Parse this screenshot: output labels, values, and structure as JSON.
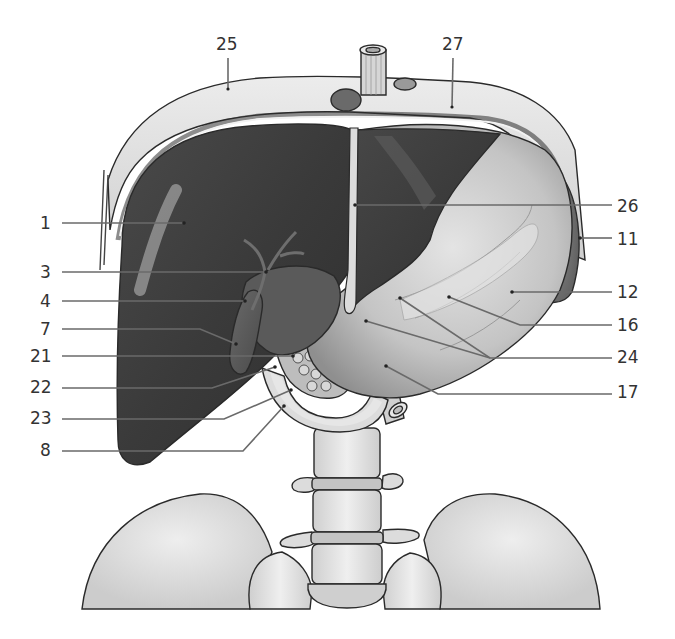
{
  "figure": {
    "colors": {
      "background": "#ffffff",
      "liver_dark": "#3e3e3e",
      "liver_mid": "#555555",
      "diaphragm": "#dcdcdc",
      "stomach": "#c8c8c8",
      "bone": "#e6e6e6",
      "label_text": "#333333",
      "leader_line": "#6a6a6a"
    },
    "labels": [
      {
        "id": "25",
        "text": "25",
        "side": "top",
        "x": 228,
        "y": 50
      },
      {
        "id": "27",
        "text": "27",
        "side": "top",
        "x": 453,
        "y": 50
      },
      {
        "id": "1",
        "text": "1",
        "side": "left",
        "x": 50,
        "y": 229
      },
      {
        "id": "3",
        "text": "3",
        "side": "left",
        "x": 50,
        "y": 278
      },
      {
        "id": "4",
        "text": "4",
        "side": "left",
        "x": 50,
        "y": 307
      },
      {
        "id": "7",
        "text": "7",
        "side": "left",
        "x": 50,
        "y": 335
      },
      {
        "id": "21",
        "text": "21",
        "side": "left",
        "x": 50,
        "y": 362
      },
      {
        "id": "22",
        "text": "22",
        "side": "left",
        "x": 50,
        "y": 393
      },
      {
        "id": "23",
        "text": "23",
        "side": "left",
        "x": 50,
        "y": 424
      },
      {
        "id": "8",
        "text": "8",
        "side": "left",
        "x": 50,
        "y": 456
      },
      {
        "id": "26",
        "text": "26",
        "side": "right",
        "x": 620,
        "y": 212
      },
      {
        "id": "11",
        "text": "11",
        "side": "right",
        "x": 620,
        "y": 245
      },
      {
        "id": "12",
        "text": "12",
        "side": "right",
        "x": 620,
        "y": 298
      },
      {
        "id": "16",
        "text": "16",
        "side": "right",
        "x": 620,
        "y": 331
      },
      {
        "id": "24",
        "text": "24",
        "side": "right",
        "x": 620,
        "y": 363
      },
      {
        "id": "17",
        "text": "17",
        "side": "right",
        "x": 620,
        "y": 398
      }
    ]
  }
}
